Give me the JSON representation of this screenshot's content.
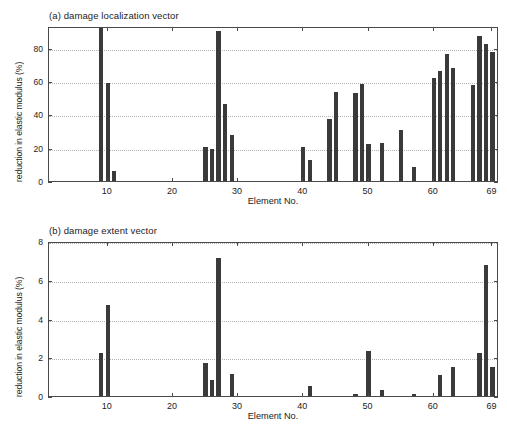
{
  "figure": {
    "background": "#ffffff",
    "bar_color": "#3a3a3a",
    "axis_color": "#4a4a4a",
    "grid_color": "#b2b2b2"
  },
  "panel_a": {
    "title": "(a) damage localization vector",
    "xlabel": "Element No.",
    "ylabel": "reduction in elastic modulus (%)"
  },
  "panel_b": {
    "title": "(b) damage extent vector",
    "xlabel": "Element No.",
    "ylabel": "reduction in elastic modulus (%)"
  },
  "chart_data": [
    {
      "type": "bar",
      "title": "(a) damage localization vector",
      "xlabel": "Element No.",
      "ylabel": "reduction in elastic modulus (%)",
      "xlim": [
        1,
        70
      ],
      "ylim": [
        0,
        93
      ],
      "xticks": [
        10,
        20,
        30,
        40,
        50,
        60,
        69
      ],
      "xtick_labels": [
        "10",
        "20",
        "30",
        "40",
        "50",
        "60",
        "69"
      ],
      "yticks": [
        0,
        20,
        40,
        60,
        80
      ],
      "ytick_labels": [
        "0",
        "20",
        "40",
        "60",
        "80"
      ],
      "grid": true,
      "grid_axis": "y",
      "legend": null,
      "categories": [
        9,
        10,
        11,
        25,
        26,
        27,
        28,
        29,
        40,
        41,
        44,
        45,
        48,
        49,
        50,
        52,
        55,
        57,
        60,
        61,
        62,
        63,
        66,
        67,
        68,
        69
      ],
      "values": [
        93,
        59,
        6,
        20.5,
        19,
        90,
        46,
        27.5,
        20.5,
        12.5,
        37.5,
        53.5,
        53,
        58.5,
        22,
        23,
        30.5,
        8.5,
        62,
        66,
        76,
        68,
        57.5,
        87,
        82,
        77.5
      ]
    },
    {
      "type": "bar",
      "title": "(b) damage extent vector",
      "xlabel": "Element No.",
      "ylabel": "reduction in elastic modulus (%)",
      "xlim": [
        1,
        70
      ],
      "ylim": [
        0,
        8
      ],
      "xticks": [
        10,
        20,
        30,
        40,
        50,
        60,
        69
      ],
      "xtick_labels": [
        "10",
        "20",
        "30",
        "40",
        "50",
        "60",
        "69"
      ],
      "yticks": [
        0,
        2,
        4,
        6,
        8
      ],
      "ytick_labels": [
        "0",
        "2",
        "4",
        "6",
        "8"
      ],
      "grid": true,
      "grid_axis": "y",
      "legend": null,
      "categories": [
        9,
        10,
        25,
        26,
        27,
        29,
        41,
        48,
        50,
        52,
        57,
        61,
        63,
        67,
        68,
        69
      ],
      "values": [
        2.2,
        4.7,
        1.7,
        0.85,
        7.1,
        1.15,
        0.5,
        0.1,
        2.3,
        0.3,
        0.1,
        1.1,
        1.5,
        2.2,
        6.75,
        1.5
      ]
    }
  ]
}
